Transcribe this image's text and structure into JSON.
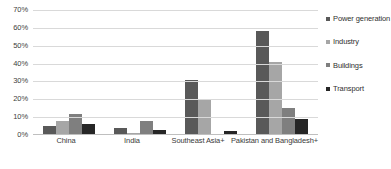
{
  "chart_data": {
    "type": "bar",
    "title": "",
    "xlabel": "",
    "ylabel": "",
    "ylim": [
      0,
      70
    ],
    "ytick_labels": [
      "70%",
      "60%",
      "50%",
      "40%",
      "30%",
      "20%",
      "10%",
      "0%"
    ],
    "ytick_values": [
      70,
      60,
      50,
      40,
      30,
      20,
      10,
      0
    ],
    "grid": true,
    "legend_position": "right",
    "categories": [
      "China",
      "India",
      "Southeast Asia+",
      "Pakistan and Bangladesh+"
    ],
    "series": [
      {
        "name": "Power generation",
        "color": "#595959",
        "values": [
          5,
          4,
          31,
          58
        ]
      },
      {
        "name": "Industry",
        "color": "#a6a6a6",
        "values": [
          8,
          1,
          20,
          41
        ]
      },
      {
        "name": "Buildings",
        "color": "#7f7f7f",
        "values": [
          12,
          8,
          0.5,
          15
        ]
      },
      {
        "name": "Transport",
        "color": "#262626",
        "values": [
          6,
          3,
          2,
          9
        ]
      }
    ]
  },
  "legend": {
    "items": [
      {
        "label": "Power generation",
        "color": "#595959"
      },
      {
        "label": "Industry",
        "color": "#a6a6a6"
      },
      {
        "label": "Buildings",
        "color": "#7f7f7f"
      },
      {
        "label": "Transport",
        "color": "#262626"
      }
    ]
  },
  "colors": {
    "gridline": "#d9d9d9",
    "baseline": "#bfbfbf",
    "tick_text": "#404040",
    "background": "#ffffff"
  }
}
